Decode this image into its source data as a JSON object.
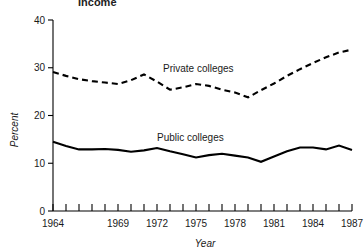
{
  "title": "Income",
  "chart_data": {
    "type": "line",
    "title": "Income",
    "xlabel": "Year",
    "ylabel": "Percent",
    "xlim": [
      1964,
      1987
    ],
    "ylim": [
      0,
      40
    ],
    "ytick_labels": [
      "0",
      "10",
      "20",
      "30",
      "40"
    ],
    "yticks": [
      0,
      10,
      20,
      30,
      40
    ],
    "xtick_labels": [
      "1964",
      "1969",
      "1972",
      "1975",
      "1978",
      "1981",
      "1984",
      "1987"
    ],
    "xticks_all_years": [
      1964,
      1965,
      1966,
      1967,
      1968,
      1969,
      1970,
      1971,
      1972,
      1973,
      1974,
      1975,
      1976,
      1977,
      1978,
      1979,
      1980,
      1981,
      1982,
      1983,
      1984,
      1985,
      1986,
      1987
    ],
    "grid": false,
    "legend_position": "inline-annotation",
    "x": [
      1964,
      1965,
      1966,
      1967,
      1968,
      1969,
      1970,
      1971,
      1972,
      1973,
      1974,
      1975,
      1976,
      1977,
      1978,
      1979,
      1980,
      1981,
      1982,
      1983,
      1984,
      1985,
      1986,
      1987
    ],
    "series": [
      {
        "name": "Private colleges",
        "style": "dashed",
        "color": "#000000",
        "values": [
          29.1,
          28.3,
          27.6,
          27.2,
          26.9,
          26.6,
          27.4,
          28.6,
          27.1,
          25.4,
          25.9,
          26.6,
          26.2,
          25.4,
          24.8,
          23.8,
          25.3,
          26.7,
          28.3,
          29.7,
          31.0,
          32.2,
          33.2,
          33.8
        ]
      },
      {
        "name": "Public colleges",
        "style": "solid",
        "color": "#000000",
        "values": [
          14.5,
          13.6,
          12.9,
          12.9,
          13.0,
          12.8,
          12.4,
          12.7,
          13.2,
          12.5,
          11.9,
          11.2,
          11.7,
          12.0,
          11.6,
          11.2,
          10.3,
          11.4,
          12.5,
          13.3,
          13.3,
          12.9,
          13.7,
          12.8
        ]
      }
    ],
    "annotations": [
      {
        "text": "Private colleges",
        "x_px": 163,
        "y_px": 72
      },
      {
        "text": "Public colleges",
        "x_px": 157,
        "y_px": 141
      }
    ]
  }
}
